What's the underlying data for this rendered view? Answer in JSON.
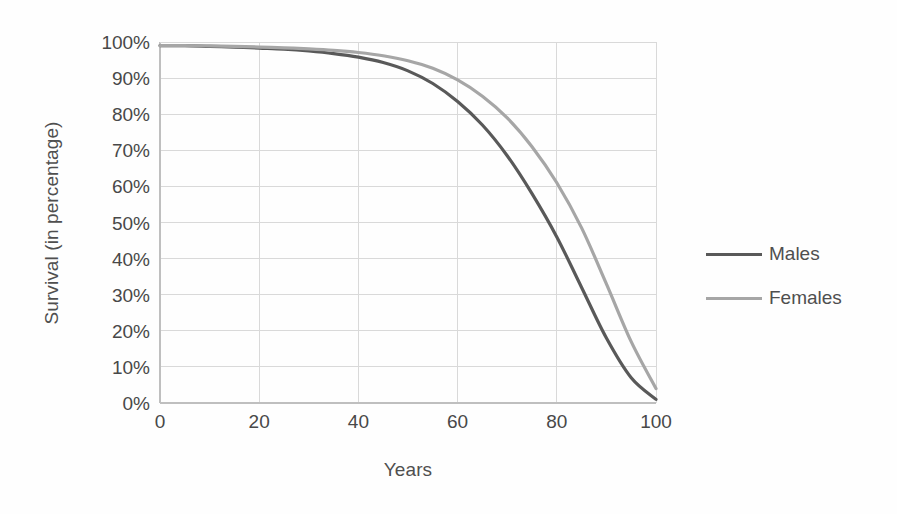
{
  "chart_data": {
    "type": "line",
    "title": "",
    "xlabel": "Years",
    "ylabel": "Survival (in percentage)",
    "xlim": [
      0,
      100
    ],
    "ylim": [
      0,
      100
    ],
    "grid": true,
    "legend_position": "right",
    "x_ticks": [
      "0",
      "20",
      "40",
      "60",
      "80",
      "100"
    ],
    "x_tick_values": [
      0,
      20,
      40,
      60,
      80,
      100
    ],
    "y_ticks": [
      "0%",
      "10%",
      "20%",
      "30%",
      "40%",
      "50%",
      "60%",
      "70%",
      "80%",
      "90%",
      "100%"
    ],
    "y_tick_values": [
      0,
      10,
      20,
      30,
      40,
      50,
      60,
      70,
      80,
      90,
      100
    ],
    "x": [
      0,
      5,
      10,
      15,
      20,
      25,
      30,
      35,
      40,
      45,
      50,
      55,
      60,
      65,
      70,
      75,
      80,
      85,
      90,
      95,
      100
    ],
    "series": [
      {
        "name": "Males",
        "color": "#595959",
        "values": [
          99,
          99,
          98.8,
          98.6,
          98.3,
          98,
          97.5,
          96.8,
          95.8,
          94.3,
          92,
          88.5,
          83.5,
          77,
          68.5,
          58,
          46,
          32,
          18,
          7,
          1
        ]
      },
      {
        "name": "Females",
        "color": "#a6a6a6",
        "values": [
          99,
          99,
          98.9,
          98.8,
          98.6,
          98.4,
          98.1,
          97.7,
          97.1,
          96.2,
          94.8,
          92.7,
          89.5,
          85,
          79,
          71,
          61,
          48.5,
          33,
          17,
          4
        ]
      }
    ]
  },
  "legend": {
    "items": [
      {
        "label": "Males",
        "color": "#595959"
      },
      {
        "label": "Females",
        "color": "#a6a6a6"
      }
    ]
  },
  "style": {
    "grid_color": "#d9d9d9",
    "axis_color": "#bfbfbf",
    "background": "#fefefe",
    "text_color": "#4a4a4a"
  }
}
